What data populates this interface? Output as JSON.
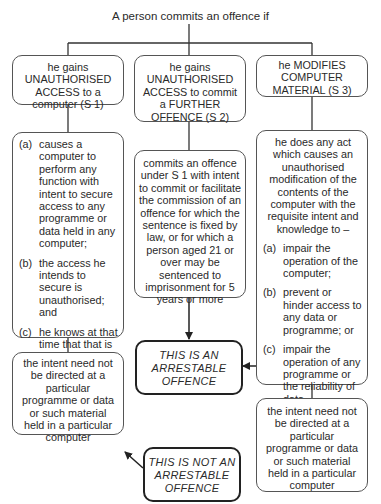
{
  "title": "A person commits an offence if",
  "columns": [
    {
      "heading": "he gains UNAUTHORISED ACCESS to a computer (S 1)",
      "heading_lines": [
        "he gains",
        "UNAUTHORISED",
        "ACCESS to a",
        "computer (S 1)"
      ],
      "conditions": [
        {
          "label": "(a)",
          "text": "causes a computer to perform any function with intent to secure access to any programme or data held in any computer;"
        },
        {
          "label": "(b)",
          "text": "the access he intends to secure is unauthorised; and"
        },
        {
          "label": "(c)",
          "text": "he knows at that time that that is the case"
        }
      ],
      "note": "the intent need not be directed at a particular programme or data or such material held in a particular computer"
    },
    {
      "heading": "he gains UNAUTHORISED ACCESS to commit a FURTHER OFFENCE (S 2)",
      "heading_lines": [
        "he gains",
        "UNAUTHORISED",
        "ACCESS to commit",
        "a FURTHER",
        "OFFENCE (S 2)"
      ],
      "description": "commits an offence under S 1 with intent to commit or facilitate the commission of an offence for which the sentence is fixed by law, or for which a person aged 21 or over may be sentenced to imprisonment for 5 years or more"
    },
    {
      "heading": "he MODIFIES COMPUTER MATERIAL (S 3)",
      "heading_lines": [
        "he MODIFIES",
        "COMPUTER",
        "MATERIAL (S 3)"
      ],
      "intro": "he does any act which causes an unauthorised modification of the contents of the computer with the requisite intent and knowledge to –",
      "conditions": [
        {
          "label": "(a)",
          "text": "impair the operation of the computer;"
        },
        {
          "label": "(b)",
          "text": "prevent or hinder access to any data or programme; or"
        },
        {
          "label": "(c)",
          "text": "impair the operation of any programme or the reliability of data"
        }
      ],
      "note": "the intent need not be directed at a particular programme or data or such material held in a particular computer"
    }
  ],
  "outcomes": {
    "arrestable": [
      "THIS IS AN",
      "ARRESTABLE",
      "OFFENCE"
    ],
    "not_arrestable": [
      "THIS IS NOT AN",
      "ARRESTABLE",
      "OFFENCE"
    ]
  }
}
